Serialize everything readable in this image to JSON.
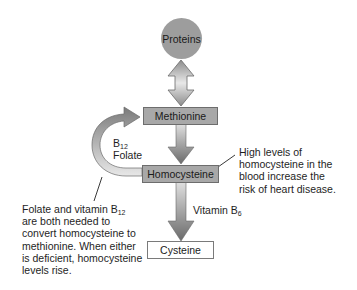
{
  "nodes": {
    "proteins": "Proteins",
    "methionine": "Methionine",
    "homocysteine": "Homocysteine",
    "cysteine": "Cysteine"
  },
  "cycle_label": {
    "b12_prefix": "B",
    "b12_sub": "12",
    "folate": "Folate"
  },
  "vitamin_b6": {
    "prefix": "Vitamin B",
    "sub": "6"
  },
  "callout_right": {
    "lines": [
      "High levels of",
      "homocysteine in the",
      "blood increase the",
      "risk of heart disease."
    ]
  },
  "callout_left": {
    "line1_prefix": "Folate and vitamin B",
    "line1_sub": "12",
    "lines": [
      "are both needed to",
      "convert homocysteine to",
      "methionine. When either",
      "is deficient, homocysteine",
      "levels rise."
    ]
  },
  "colors": {
    "node_fill": "#a8a8a8",
    "circle_fill": "#9d9d9d",
    "arrow_dark": "#707070",
    "arrow_light": "#e6e6e6"
  }
}
